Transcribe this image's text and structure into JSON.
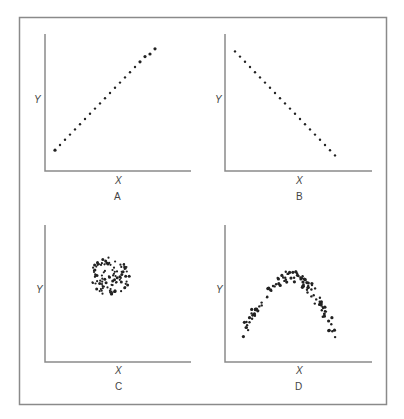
{
  "figure": {
    "frame_color": "#8a8a8a",
    "axis_color": "#8a8a8a",
    "dot_color": "#222222"
  },
  "panels": [
    {
      "id": "A",
      "label": "A",
      "xlabel": "X",
      "ylabel": "Y",
      "relationship": "strong positive linear"
    },
    {
      "id": "B",
      "label": "B",
      "xlabel": "X",
      "ylabel": "Y",
      "relationship": "strong negative linear"
    },
    {
      "id": "C",
      "label": "C",
      "xlabel": "X",
      "ylabel": "Y",
      "relationship": "no correlation (circular cloud)"
    },
    {
      "id": "D",
      "label": "D",
      "xlabel": "X",
      "ylabel": "Y",
      "relationship": "curvilinear (inverted U)"
    }
  ],
  "chart_data": [
    {
      "type": "scatter",
      "title": "A",
      "xlabel": "X",
      "ylabel": "Y",
      "grid": false,
      "xlim": [
        0,
        10
      ],
      "ylim": [
        0,
        10
      ],
      "x": [
        0.8,
        1.2,
        1.6,
        2.0,
        2.4,
        2.8,
        3.2,
        3.6,
        4.0,
        4.4,
        4.8,
        5.2,
        5.6,
        6.0,
        6.4,
        6.8,
        7.2,
        7.6,
        8.0,
        8.4,
        8.8
      ],
      "y": [
        1.6,
        2.0,
        2.4,
        2.8,
        3.2,
        3.6,
        4.0,
        4.4,
        4.8,
        5.2,
        5.6,
        6.0,
        6.4,
        6.8,
        7.2,
        7.6,
        8.0,
        8.4,
        8.8,
        9.0,
        9.4
      ]
    },
    {
      "type": "scatter",
      "title": "B",
      "xlabel": "X",
      "ylabel": "Y",
      "grid": false,
      "xlim": [
        0,
        10
      ],
      "ylim": [
        0,
        10
      ],
      "x": [
        0.8,
        1.2,
        1.6,
        2.0,
        2.4,
        2.8,
        3.2,
        3.6,
        4.0,
        4.4,
        4.8,
        5.2,
        5.6,
        6.0,
        6.4,
        6.8,
        7.2,
        7.6,
        8.0,
        8.4,
        8.8
      ],
      "y": [
        9.2,
        8.8,
        8.4,
        8.0,
        7.6,
        7.2,
        6.8,
        6.4,
        6.0,
        5.6,
        5.2,
        4.8,
        4.4,
        4.0,
        3.6,
        3.2,
        2.8,
        2.4,
        2.0,
        1.6,
        1.2
      ]
    },
    {
      "type": "scatter",
      "title": "C",
      "xlabel": "X",
      "ylabel": "Y",
      "grid": false,
      "xlim": [
        0,
        10
      ],
      "ylim": [
        0,
        10
      ],
      "description": "Roughly circular cloud of ~100 points centered near (5.2, 6.6), radius ~1.6",
      "center": [
        5.2,
        6.6
      ],
      "radius": 1.6,
      "n_points": 100
    },
    {
      "type": "scatter",
      "title": "D",
      "xlabel": "X",
      "ylabel": "Y",
      "grid": false,
      "xlim": [
        0,
        10
      ],
      "ylim": [
        0,
        10
      ],
      "description": "Inverted-U (arch) band of ~110 points: rises from (1.5, 2.3) to a peak near (5.4, 6.6) and falls to (8.8, 2.1)",
      "x": [
        1.5,
        2.0,
        2.5,
        3.0,
        3.5,
        4.0,
        4.5,
        5.0,
        5.4,
        6.0,
        6.5,
        7.0,
        7.5,
        8.0,
        8.5,
        8.8
      ],
      "y": [
        2.3,
        3.3,
        4.2,
        4.9,
        5.5,
        5.9,
        6.3,
        6.5,
        6.6,
        6.4,
        6.0,
        5.4,
        4.6,
        3.7,
        2.8,
        2.1
      ],
      "n_points": 110
    }
  ]
}
